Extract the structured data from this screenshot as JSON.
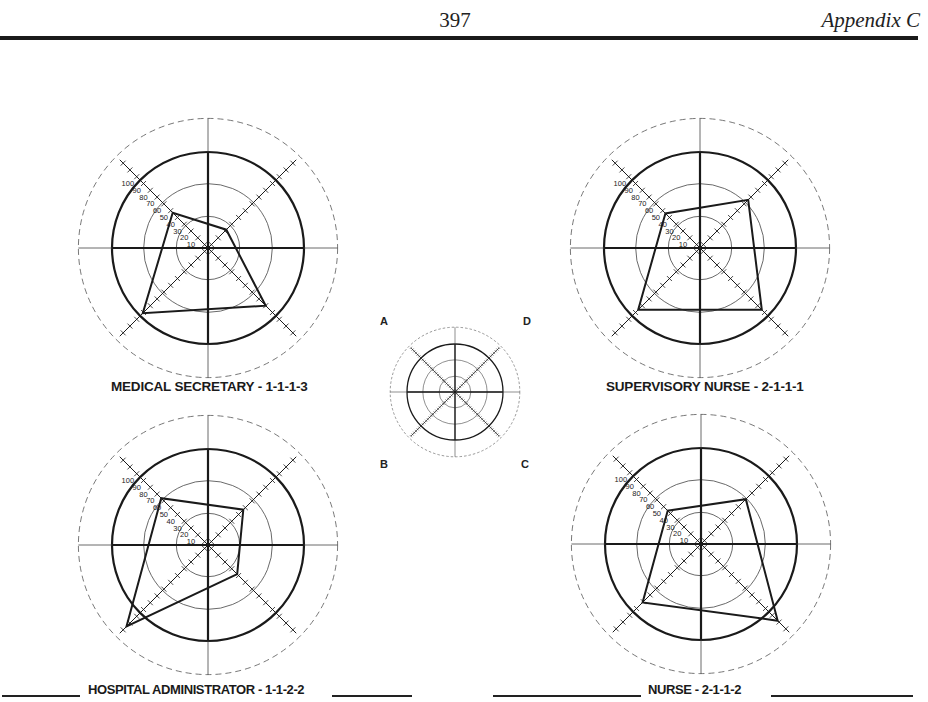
{
  "header": {
    "page_number": "397",
    "running_head": "Appendix C"
  },
  "key": {
    "labels": {
      "A": "A",
      "B": "B",
      "C": "C",
      "D": "D"
    },
    "center": [
      455,
      392
    ]
  },
  "colors": {
    "ink": "#1a1a1a",
    "thin": "#444444",
    "dashed": "#555555"
  },
  "chart_data": [
    {
      "type": "radar",
      "title": "MEDICAL SECRETARY - 1-1-1-3",
      "axes": [
        "A",
        "B",
        "C",
        "D"
      ],
      "axis_positions": {
        "A": "upper-left",
        "B": "lower-left",
        "C": "lower-right",
        "D": "upper-right"
      },
      "tick_labels": [
        "10",
        "20",
        "30",
        "40",
        "50",
        "60",
        "70",
        "80",
        "90",
        "100"
      ],
      "range": [
        0,
        130
      ],
      "values": {
        "A": 52,
        "B": 96,
        "C": 85,
        "D": 27
      },
      "center": [
        208,
        248
      ]
    },
    {
      "type": "radar",
      "title": "SUPERVISORY NURSE - 2-1-1-1",
      "axes": [
        "A",
        "B",
        "C",
        "D"
      ],
      "axis_positions": {
        "A": "upper-left",
        "B": "lower-left",
        "C": "lower-right",
        "D": "upper-right"
      },
      "tick_labels": [
        "10",
        "20",
        "30",
        "40",
        "50",
        "60",
        "70",
        "80",
        "90",
        "100"
      ],
      "range": [
        0,
        130
      ],
      "values": {
        "A": 51,
        "B": 91,
        "C": 91,
        "D": 71
      },
      "center": [
        700,
        248
      ]
    },
    {
      "type": "radar",
      "title": "HOSPITAL ADMINISTRATOR - 1-1-2-2",
      "axes": [
        "A",
        "B",
        "C",
        "D"
      ],
      "axis_positions": {
        "A": "upper-left",
        "B": "lower-left",
        "C": "lower-right",
        "D": "upper-right"
      },
      "tick_labels": [
        "10",
        "20",
        "30",
        "40",
        "50",
        "60",
        "70",
        "80",
        "90",
        "100"
      ],
      "range": [
        0,
        130
      ],
      "values": {
        "A": 69,
        "B": 120,
        "C": 43,
        "D": 52
      },
      "center": [
        208,
        545
      ]
    },
    {
      "type": "radar",
      "title": "NURSE - 2-1-1-2",
      "axes": [
        "A",
        "B",
        "C",
        "D"
      ],
      "axis_positions": {
        "A": "upper-left",
        "B": "lower-left",
        "C": "lower-right",
        "D": "upper-right"
      },
      "tick_labels": [
        "10",
        "20",
        "30",
        "40",
        "50",
        "60",
        "70",
        "80",
        "90",
        "100"
      ],
      "range": [
        0,
        130
      ],
      "values": {
        "A": 49,
        "B": 86,
        "C": 113,
        "D": 66
      },
      "center": [
        701,
        544
      ]
    }
  ]
}
